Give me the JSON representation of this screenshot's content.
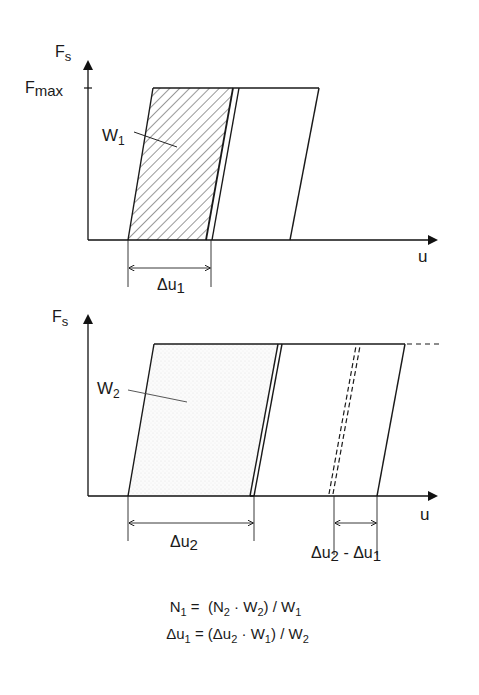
{
  "diagram": {
    "top_chart": {
      "y_axis_label": "F",
      "y_axis_label_sub": "s",
      "y_tick_label": "F",
      "y_tick_label_sub": "max",
      "x_axis_label": "u",
      "area_label": "W",
      "area_label_sub": "1",
      "dimension_label": "Δu",
      "dimension_label_sub": "1"
    },
    "bottom_chart": {
      "y_axis_label": "F",
      "y_axis_label_sub": "s",
      "x_axis_label": "u",
      "area_label": "W",
      "area_label_sub": "2",
      "dimension_label": "Δu",
      "dimension_label_sub": "2",
      "difference_label_a": "Δu",
      "difference_label_a_sub": "2",
      "difference_label_op": " - ",
      "difference_label_b": "Δu",
      "difference_label_b_sub": "1"
    },
    "formulas": [
      {
        "lhs": "N",
        "lhs_sub": "1",
        "eq": " =  (",
        "t1": "N",
        "t1_sub": "2",
        "op": " · ",
        "t2": "W",
        "t2_sub": "2",
        "div": ") / ",
        "t3": "W",
        "t3_sub": "1"
      },
      {
        "lhs": "Δu",
        "lhs_sub": "1",
        "eq": " = (",
        "t1": "Δu",
        "t1_sub": "2",
        "op": " · ",
        "t2": "W",
        "t2_sub": "1",
        "div": ") / ",
        "t3": "W",
        "t3_sub": "2"
      }
    ]
  }
}
